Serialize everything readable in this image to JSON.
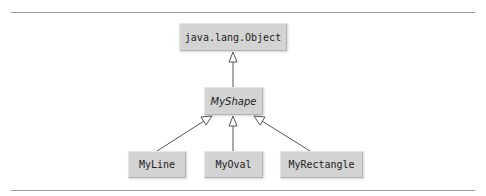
{
  "diagram": {
    "type": "uml-class-hierarchy",
    "classes": {
      "object": {
        "name": "java.lang.Object",
        "abstract": false
      },
      "shape": {
        "name": "MyShape",
        "abstract": true
      },
      "line": {
        "name": "MyLine",
        "abstract": false
      },
      "oval": {
        "name": "MyOval",
        "abstract": false
      },
      "rect": {
        "name": "MyRectangle",
        "abstract": false
      }
    },
    "relationships": [
      {
        "from": "MyShape",
        "to": "java.lang.Object",
        "type": "generalization"
      },
      {
        "from": "MyLine",
        "to": "MyShape",
        "type": "generalization"
      },
      {
        "from": "MyOval",
        "to": "MyShape",
        "type": "generalization"
      },
      {
        "from": "MyRectangle",
        "to": "MyShape",
        "type": "generalization"
      }
    ],
    "colors": {
      "box_fill": "#d3d3d3",
      "line": "#555555",
      "rule": "#9a9a9a"
    }
  }
}
